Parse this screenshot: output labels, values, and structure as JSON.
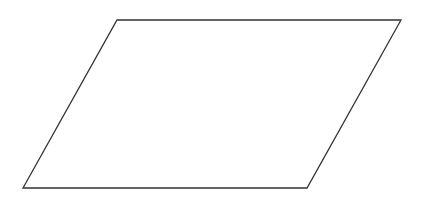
{
  "diagram": {
    "shape": "parallelogram",
    "stroke_color": "#333333",
    "fill_color": "#ffffff",
    "stroke_width": 1.3,
    "vertices": {
      "top_left": [
        117,
        20
      ],
      "top_right": [
        401,
        20
      ],
      "bottom_right": [
        307,
        188
      ],
      "bottom_left": [
        23,
        188
      ]
    }
  }
}
